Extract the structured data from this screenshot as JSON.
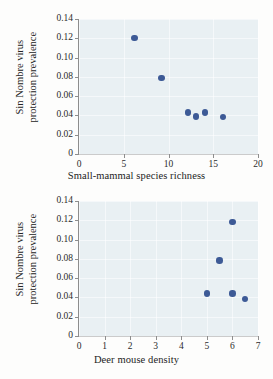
{
  "chart_data": [
    {
      "id": "top",
      "type": "scatter",
      "title": "",
      "xlabel": "Small-mammal species richness",
      "ylabel": "Sin Nombre virus protection prevalence",
      "ylabel_lines": [
        "Sin Nombre virus",
        "protection prevalence"
      ],
      "xlim": [
        0,
        20
      ],
      "ylim": [
        0,
        0.14
      ],
      "xticks": [
        0,
        5,
        10,
        15,
        20
      ],
      "xticklabels": [
        "0",
        "5",
        "10",
        "15",
        "20"
      ],
      "yticks": [
        0,
        0.02,
        0.04,
        0.06,
        0.08,
        0.1,
        0.12,
        0.14
      ],
      "yticklabels": [
        "0",
        "0.02",
        "0.04",
        "0.06",
        "0.08",
        "0.10",
        "0.12",
        "0.14"
      ],
      "grid": false,
      "legend": null,
      "marker_color": "#3d5a96",
      "plot_bg": "#e9f0f3",
      "points": [
        {
          "x": 6.2,
          "y": 0.12
        },
        {
          "x": 9.2,
          "y": 0.079
        },
        {
          "x": 12.2,
          "y": 0.0432
        },
        {
          "x": 13.1,
          "y": 0.039
        },
        {
          "x": 14.1,
          "y": 0.043
        },
        {
          "x": 16.1,
          "y": 0.0385
        }
      ]
    },
    {
      "id": "bottom",
      "type": "scatter",
      "title": "",
      "xlabel": "Deer mouse density",
      "ylabel": "Sin Nombre virus protection prevalence",
      "ylabel_lines": [
        "Sin Nombre virus",
        "protection prevalence"
      ],
      "xlim": [
        0,
        7
      ],
      "ylim": [
        0,
        0.14
      ],
      "xticks": [
        0,
        1,
        2,
        3,
        4,
        5,
        6,
        7
      ],
      "xticklabels": [
        "0",
        "1",
        "2",
        "3",
        "4",
        "5",
        "6",
        "7"
      ],
      "yticks": [
        0,
        0.02,
        0.04,
        0.06,
        0.08,
        0.1,
        0.12,
        0.14
      ],
      "yticklabels": [
        "0",
        "0.02",
        "0.04",
        "0.06",
        "0.08",
        "0.10",
        "0.12",
        "0.14"
      ],
      "grid": false,
      "legend": null,
      "marker_color": "#3d5a96",
      "plot_bg": "#e9f0f3",
      "points": [
        {
          "x": 6.0,
          "y": 0.118
        },
        {
          "x": 5.5,
          "y": 0.0785
        },
        {
          "x": 5.0,
          "y": 0.0442
        },
        {
          "x": 6.0,
          "y": 0.044
        },
        {
          "x": 6.5,
          "y": 0.0385
        }
      ]
    }
  ]
}
